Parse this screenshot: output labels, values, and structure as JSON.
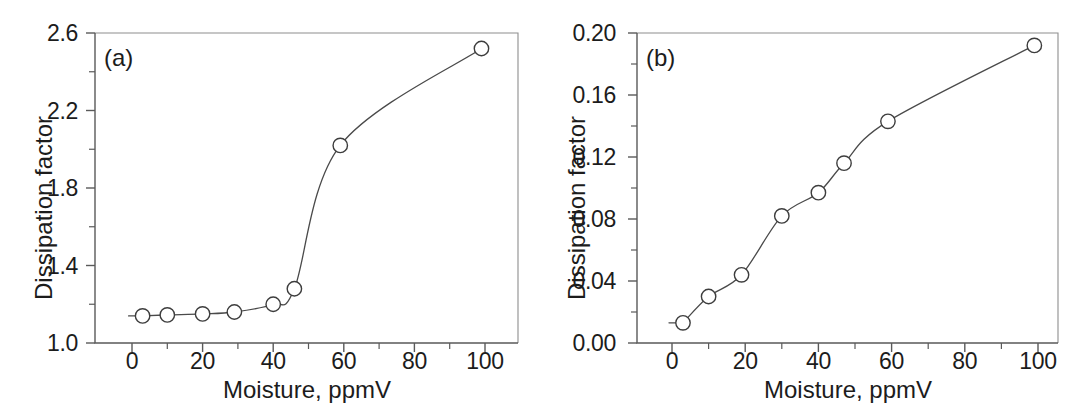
{
  "figure": {
    "background_color": "#ffffff",
    "line_color": "#4a4a4a",
    "marker_face_color": "#ffffff",
    "marker_edge_color": "#3d3d3d",
    "axis_color": "#5a5a5a"
  },
  "chart_data": [
    {
      "type": "line",
      "panel_tag": "(a)",
      "title": "",
      "xlabel": "Moisture, ppmV",
      "ylabel": "Dissipation factor",
      "xlim": [
        -10,
        110
      ],
      "ylim": [
        1.0,
        2.6
      ],
      "grid": false,
      "legend": "none",
      "marker": "open-circle",
      "xticks": [
        0,
        20,
        40,
        60,
        80,
        100
      ],
      "xtick_labels": [
        "0",
        "20",
        "40",
        "60",
        "80",
        "100"
      ],
      "xminor_ticks": [
        10,
        30,
        50,
        70,
        90
      ],
      "yticks": [
        1.0,
        1.4,
        1.8,
        2.2,
        2.6
      ],
      "ytick_labels": [
        "1.0",
        "1.4",
        "1.8",
        "2.2",
        "2.6"
      ],
      "yminor_ticks": [
        1.2,
        1.6,
        2.0,
        2.4
      ],
      "x": [
        3,
        10,
        20,
        29,
        40,
        46,
        59,
        99
      ],
      "values": [
        1.14,
        1.145,
        1.15,
        1.16,
        1.2,
        1.28,
        2.02,
        2.52
      ]
    },
    {
      "type": "line",
      "panel_tag": "(b)",
      "title": "",
      "xlabel": "Moisture, ppmV",
      "ylabel": "Dissipation factor",
      "xlim": [
        -10,
        110
      ],
      "ylim": [
        0.0,
        0.2
      ],
      "grid": false,
      "legend": "none",
      "marker": "open-circle",
      "xticks": [
        0,
        20,
        40,
        60,
        80,
        100
      ],
      "xtick_labels": [
        "0",
        "20",
        "40",
        "60",
        "80",
        "100"
      ],
      "xminor_ticks": [
        10,
        30,
        50,
        70,
        90
      ],
      "yticks": [
        0.0,
        0.04,
        0.08,
        0.12,
        0.16,
        0.2
      ],
      "ytick_labels": [
        "0.00",
        "0.04",
        "0.08",
        "0.12",
        "0.16",
        "0.20"
      ],
      "yminor_ticks": [
        0.02,
        0.06,
        0.1,
        0.14,
        0.18
      ],
      "x": [
        3,
        10,
        19,
        30,
        40,
        47,
        59,
        99
      ],
      "values": [
        0.013,
        0.03,
        0.044,
        0.082,
        0.097,
        0.116,
        0.143,
        0.192
      ]
    }
  ]
}
